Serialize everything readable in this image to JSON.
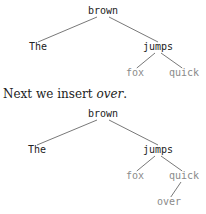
{
  "tree1": {
    "nodes": [
      {
        "id": "brown",
        "label": "brown",
        "x": 103,
        "y": 5,
        "tone": "dark"
      },
      {
        "id": "The",
        "label": "The",
        "x": 38,
        "y": 41,
        "tone": "dark"
      },
      {
        "id": "jumps",
        "label": "jumps",
        "x": 158,
        "y": 41,
        "tone": "dark"
      },
      {
        "id": "fox",
        "label": "fox",
        "x": 135,
        "y": 67,
        "tone": "light"
      },
      {
        "id": "quick",
        "label": "quick",
        "x": 184,
        "y": 67,
        "tone": "light"
      }
    ],
    "edges": [
      [
        "brown",
        "The"
      ],
      [
        "brown",
        "jumps"
      ],
      [
        "jumps",
        "fox"
      ],
      [
        "jumps",
        "quick"
      ]
    ]
  },
  "caption": {
    "prefix": "Next we insert ",
    "emphasis": "over",
    "suffix": "."
  },
  "tree2": {
    "nodes": [
      {
        "id": "brown",
        "label": "brown",
        "x": 103,
        "y": 108,
        "tone": "dark"
      },
      {
        "id": "The",
        "label": "The",
        "x": 37,
        "y": 144,
        "tone": "dark"
      },
      {
        "id": "jumps",
        "label": "jumps",
        "x": 158,
        "y": 144,
        "tone": "dark"
      },
      {
        "id": "fox",
        "label": "fox",
        "x": 135,
        "y": 170,
        "tone": "light"
      },
      {
        "id": "quick",
        "label": "quick",
        "x": 184,
        "y": 170,
        "tone": "light"
      },
      {
        "id": "over",
        "label": "over",
        "x": 169,
        "y": 196,
        "tone": "light"
      }
    ],
    "edges": [
      [
        "brown",
        "The"
      ],
      [
        "brown",
        "jumps"
      ],
      [
        "jumps",
        "fox"
      ],
      [
        "jumps",
        "quick"
      ],
      [
        "quick",
        "over"
      ]
    ]
  },
  "colors": {
    "dark_text": "#222222",
    "light_text": "#8a8a8a",
    "edge": "#555555"
  }
}
